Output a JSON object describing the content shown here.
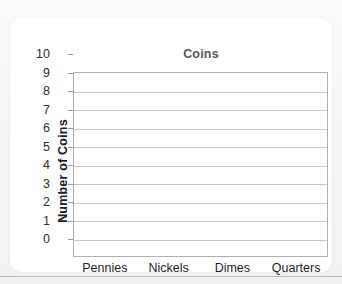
{
  "chart_data": {
    "type": "bar",
    "title": "Coins",
    "xlabel": "",
    "ylabel": "Number of Coins",
    "categories": [
      "Pennies",
      "Nickels",
      "Dimes",
      "Quarters"
    ],
    "values": [
      null,
      null,
      null,
      null
    ],
    "ylim": [
      0,
      10
    ],
    "ytick_step": 1,
    "yticks": [
      "10",
      "9",
      "8",
      "7",
      "6",
      "5",
      "4",
      "3",
      "2",
      "1",
      "0"
    ],
    "grid": "horizontal",
    "legend": "none",
    "note": "empty bar-graph template; no bars plotted",
    "colors": {
      "title_text": "#575757",
      "axis_text": "#2e2e2e",
      "axis_title_text": "#1c1c1c",
      "gridline": "#c9c9c9",
      "plot_border": "#b0b0b0",
      "card_background": "#ffffff",
      "page_background": "#f2f2f2",
      "rule": "#b9b9b9"
    }
  }
}
